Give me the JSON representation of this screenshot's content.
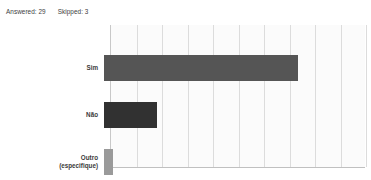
{
  "summary": {
    "answered_label": "Answered: 29",
    "skipped_label": "Skipped: 3"
  },
  "chart_data": {
    "type": "bar",
    "orientation": "horizontal",
    "title": "",
    "xlabel": "",
    "ylabel": "",
    "grid": true,
    "legend": false,
    "xlim": [
      0,
      100
    ],
    "categories": [
      "Sim",
      "Não",
      "Outro\n(especifique)"
    ],
    "values": [
      75.9,
      20.7,
      3.4
    ],
    "tick_labels": [
      "0%",
      "10%",
      "20%",
      "30%",
      "40%",
      "50%",
      "60%",
      "70%",
      "80%",
      "90%",
      "100%"
    ],
    "tick_values": [
      0,
      10,
      20,
      30,
      40,
      50,
      60,
      70,
      80,
      90,
      100
    ],
    "bar_colors": [
      "#555555",
      "#313131",
      "#9a9a9a"
    ],
    "grid_color": "#dcdcdc",
    "plot_background": "#fbfbfb"
  }
}
